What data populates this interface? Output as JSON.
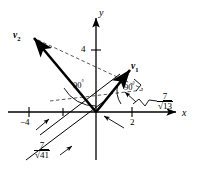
{
  "figure": {
    "axes": {
      "x_label": "x",
      "y_label": "y",
      "x_ticks": [
        {
          "label": "−4",
          "value": -4
        },
        {
          "label": "2",
          "value": 2
        }
      ],
      "y_ticks": [
        {
          "label": "4",
          "value": 4
        }
      ]
    },
    "vectors": [
      {
        "name": "v1",
        "label": "v",
        "sub": "1"
      },
      {
        "name": "v2",
        "label": "v",
        "sub": "2"
      }
    ],
    "angles": [
      {
        "name": "right-angle-left",
        "label": "90",
        "unit": "°"
      },
      {
        "name": "right-angle-right",
        "label": "90",
        "unit": "°"
      }
    ],
    "distance_labels": [
      {
        "name": "distance-13",
        "numerator": "7",
        "radical": "√",
        "radicand": "13"
      },
      {
        "name": "distance-41",
        "numerator": "7",
        "radical": "√",
        "radicand": "41"
      }
    ],
    "colors": {
      "stroke": "#000000",
      "background": "#ffffff",
      "dashed": "#555555"
    }
  }
}
